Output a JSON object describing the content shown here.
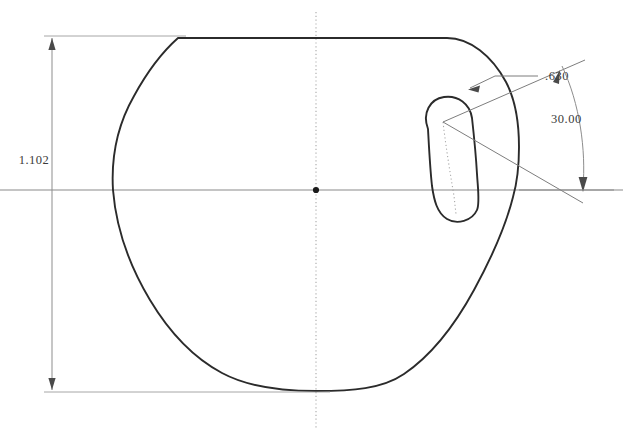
{
  "drawing": {
    "title": "Rotor profile section view",
    "background_color": "#ffffff",
    "line_color": "#2b2b2b",
    "construction_color": "#8d8d8d",
    "text_color": "#3a3a3a",
    "dimensions": [
      {
        "id": "overall-height",
        "label": "1.102",
        "type": "linear",
        "orientation": "vertical",
        "position": "left",
        "text_x": 34,
        "text_y": 164,
        "line_x": 52,
        "line_y_top": 38,
        "line_y_bottom": 390
      },
      {
        "id": "slot-offset",
        "label": ".630",
        "type": "linear",
        "orientation": "angled-leader",
        "position": "upper-right",
        "text_x": 545,
        "text_y": 80
      },
      {
        "id": "slot-angle",
        "label": "30.00",
        "type": "angular",
        "unit": "degrees",
        "position": "right",
        "text_x": 551,
        "text_y": 123
      }
    ],
    "geometry": {
      "center_point": {
        "x": 316,
        "y": 190
      },
      "horizontal_centerline_y": 190,
      "vertical_centerline_x": 316,
      "profile_top_y": 38,
      "profile_bottom_y": 390,
      "profile_left_x": 113,
      "profile_right_x": 519,
      "slot_angle_degrees": 30,
      "slot_center_upper": {
        "x": 443,
        "y": 122
      },
      "slot_center_lower": {
        "x": 465,
        "y": 205
      }
    }
  }
}
